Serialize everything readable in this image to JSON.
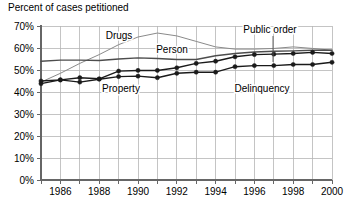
{
  "chart_data": {
    "type": "line",
    "title": "Percent of cases petitioned",
    "xlabel": "",
    "ylabel": "",
    "ylim": [
      0,
      70
    ],
    "xlim": [
      1985,
      2000
    ],
    "grid": true,
    "legend_position": "inline-annotations",
    "x": [
      1985,
      1986,
      1987,
      1988,
      1989,
      1990,
      1991,
      1992,
      1993,
      1994,
      1995,
      1996,
      1997,
      1998,
      1999,
      2000
    ],
    "xticks": [
      1985,
      1986,
      1987,
      1988,
      1989,
      1990,
      1991,
      1992,
      1993,
      1994,
      1995,
      1996,
      1997,
      1998,
      1999,
      2000
    ],
    "xtick_labels": [
      "",
      "1986",
      "",
      "1988",
      "",
      "1990",
      "",
      "1992",
      "",
      "1994",
      "",
      "1996",
      "",
      "1998",
      "",
      "2000"
    ],
    "yticks": [
      0,
      10,
      20,
      30,
      40,
      50,
      60,
      70
    ],
    "ytick_labels": [
      "0%",
      "10%",
      "20%",
      "30%",
      "40%",
      "50%",
      "60%",
      "70%"
    ],
    "series": [
      {
        "name": "Drugs",
        "label": "Drugs",
        "markers": false,
        "color": "#8a8a8a",
        "width": 1,
        "values": [
          44.5,
          48.5,
          53.0,
          57.0,
          61.5,
          65.0,
          66.8,
          65.5,
          63.0,
          60.5,
          59.5,
          59.5,
          59.8,
          60.5,
          59.8,
          59.0
        ]
      },
      {
        "name": "Person",
        "label": "Person",
        "markers": false,
        "color": "#4d4d4d",
        "width": 1.4,
        "values": [
          54.0,
          54.5,
          54.5,
          54.3,
          55.0,
          55.5,
          55.2,
          54.8,
          54.8,
          56.5,
          57.5,
          58.2,
          58.5,
          58.7,
          59.0,
          59.0
        ]
      },
      {
        "name": "Delinquency",
        "label": "Delinquency",
        "markers": true,
        "color": "#1a1a1a",
        "width": 1.4,
        "values": [
          45.0,
          45.5,
          46.5,
          46.0,
          49.5,
          49.8,
          49.8,
          51.0,
          53.0,
          54.0,
          56.0,
          57.0,
          57.2,
          57.5,
          58.0,
          57.5
        ]
      },
      {
        "name": "Property",
        "label": "Property",
        "markers": true,
        "color": "#1a1a1a",
        "width": 1.4,
        "values": [
          43.8,
          45.5,
          44.5,
          45.8,
          47.0,
          47.2,
          46.5,
          48.5,
          49.0,
          49.0,
          51.5,
          52.0,
          52.0,
          52.5,
          52.5,
          53.5
        ]
      }
    ],
    "annotations": [
      {
        "text": "Drugs",
        "x": 119,
        "y": 39,
        "anchor": "middle",
        "leader": null
      },
      {
        "text": "Person",
        "x": 172,
        "y": 53,
        "anchor": "middle",
        "leader": null
      },
      {
        "text": "Property",
        "x": 121,
        "y": 92,
        "anchor": "middle",
        "leader": null
      },
      {
        "text": "Delinquency",
        "x": 262,
        "y": 92,
        "anchor": "middle",
        "leader": null
      },
      {
        "text": "Public order",
        "x": 270,
        "y": 33,
        "anchor": "middle",
        "leader": {
          "x1": 273,
          "y1": 36,
          "x2": 273,
          "y2": 62
        }
      }
    ]
  },
  "colors": {
    "axis": "#666666",
    "grid": "#b5b5b5",
    "text": "#000000",
    "drugs": "#8a8a8a",
    "person": "#4d4d4d",
    "delinquency": "#1a1a1a",
    "property": "#1a1a1a"
  }
}
